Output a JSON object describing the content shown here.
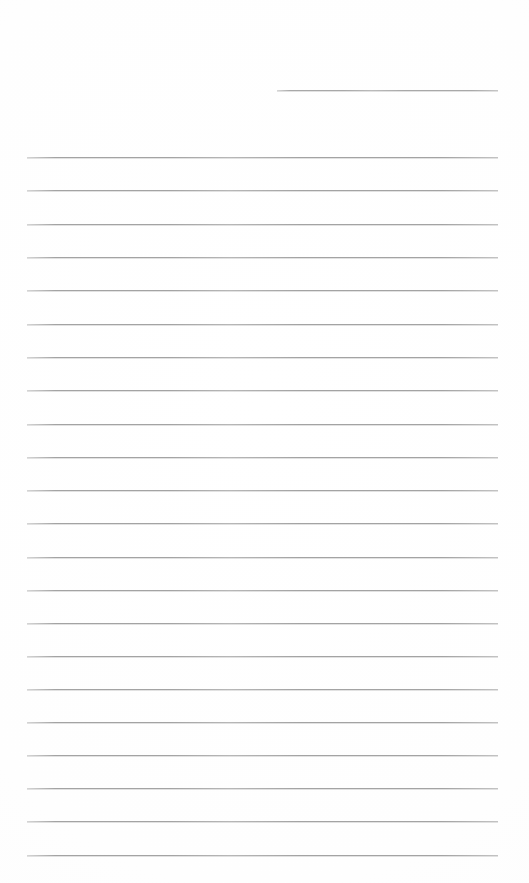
{
  "document": {
    "kind": "ruled-notepad-page",
    "title": "Blank lined page",
    "page_width": 529,
    "page_height": 883,
    "background_color": "#ffffff",
    "has_text_content": false,
    "visible_text": ""
  },
  "ruling": {
    "line_color": "#a3a3a3",
    "line_thickness_px": 1,
    "line_spacing_px": 33.2,
    "full_rule_left_x": 27,
    "full_rule_right_x": 498,
    "first_full_rule_y": 157,
    "last_full_rule_y": 855,
    "full_rule_count": 22,
    "top_margin_px": 157,
    "left_margin_px": 27,
    "right_margin_px": 31
  },
  "header_rule": {
    "name": "short-top-rule",
    "color": "#a8a8a8",
    "left_x": 277,
    "right_x": 498,
    "y": 90,
    "width_px": 221,
    "thickness_px": 1
  },
  "lines": [
    {
      "index": 1,
      "y": 157,
      "x1": 27,
      "x2": 498
    },
    {
      "index": 2,
      "y": 190,
      "x1": 27,
      "x2": 498
    },
    {
      "index": 3,
      "y": 224,
      "x1": 27,
      "x2": 498
    },
    {
      "index": 4,
      "y": 257,
      "x1": 27,
      "x2": 498
    },
    {
      "index": 5,
      "y": 290,
      "x1": 27,
      "x2": 498
    },
    {
      "index": 6,
      "y": 324,
      "x1": 27,
      "x2": 498
    },
    {
      "index": 7,
      "y": 357,
      "x1": 27,
      "x2": 498
    },
    {
      "index": 8,
      "y": 390,
      "x1": 27,
      "x2": 498
    },
    {
      "index": 9,
      "y": 424,
      "x1": 27,
      "x2": 498
    },
    {
      "index": 10,
      "y": 457,
      "x1": 27,
      "x2": 498
    },
    {
      "index": 11,
      "y": 490,
      "x1": 27,
      "x2": 498
    },
    {
      "index": 12,
      "y": 523,
      "x1": 27,
      "x2": 498
    },
    {
      "index": 13,
      "y": 557,
      "x1": 27,
      "x2": 498
    },
    {
      "index": 14,
      "y": 590,
      "x1": 27,
      "x2": 498
    },
    {
      "index": 15,
      "y": 623,
      "x1": 27,
      "x2": 498
    },
    {
      "index": 16,
      "y": 656,
      "x1": 27,
      "x2": 498
    },
    {
      "index": 17,
      "y": 689,
      "x1": 27,
      "x2": 498
    },
    {
      "index": 18,
      "y": 722,
      "x1": 27,
      "x2": 498
    },
    {
      "index": 19,
      "y": 755,
      "x1": 27,
      "x2": 498
    },
    {
      "index": 20,
      "y": 788,
      "x1": 27,
      "x2": 498
    },
    {
      "index": 21,
      "y": 821,
      "x1": 27,
      "x2": 498
    },
    {
      "index": 22,
      "y": 855,
      "x1": 27,
      "x2": 498
    }
  ]
}
